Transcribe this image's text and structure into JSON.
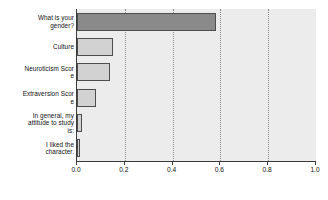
{
  "chart_data": {
    "type": "bar",
    "orientation": "horizontal",
    "title": "",
    "subtitle": "",
    "xlabel": "",
    "ylabel": "",
    "xlim": [
      0.0,
      1.0
    ],
    "grid": true,
    "gridlines_axis": "x",
    "legend": null,
    "legend_position": "none",
    "categories": [
      "What is your gender?",
      "Culture",
      "Neuroticism Score",
      "Extraversion Score",
      "In general, my attitude to study is:",
      "I liked the character."
    ],
    "category_labels_wrapped": [
      "What is your\ngender?",
      "Culture",
      "Neuroticism Scor\ne",
      "Extraversion Scor\ne",
      "In general, my\nattitude to study\nis:",
      "I liked the\ncharacter."
    ],
    "values": [
      0.58,
      0.15,
      0.14,
      0.08,
      0.02,
      0.01
    ],
    "bar_colors": [
      "#8a8a8a",
      "#d2d2d2",
      "#d2d2d2",
      "#d2d2d2",
      "#d2d2d2",
      "#d2d2d2"
    ],
    "bar_edge_color": "#4d4d4d",
    "xticks": [
      0.0,
      0.2,
      0.4,
      0.6,
      0.8,
      1.0
    ],
    "xtick_labels": [
      "0.0",
      "0.2",
      "0.4",
      "0.6",
      "0.8",
      "1.0"
    ],
    "plot_background": "#ececed",
    "figure_background": "#ffffff",
    "gridline_color": "#8d8d8d",
    "axis_color": "#3a3a3a",
    "text_color": "#111111"
  }
}
